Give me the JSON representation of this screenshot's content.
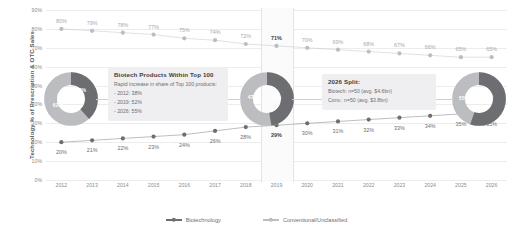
{
  "chart_data": {
    "type": "line",
    "title": "",
    "xlabel": "",
    "ylabel": "Technology % of Prescription & OTC Sales",
    "ylim": [
      0,
      90
    ],
    "ytick_labels": [
      "0%",
      "10%",
      "20%",
      "30%",
      "40%",
      "50%",
      "60%",
      "70%",
      "80%",
      "90%"
    ],
    "ytick_values": [
      0,
      10,
      20,
      30,
      40,
      50,
      60,
      70,
      80,
      90
    ],
    "grid": true,
    "legend_position": "bottom",
    "categories": [
      "2012",
      "2013",
      "2014",
      "2015",
      "2016",
      "2017",
      "2018",
      "2019",
      "2020",
      "2021",
      "2022",
      "2023",
      "2024",
      "2025",
      "2026"
    ],
    "series": [
      {
        "name": "Biotechnology",
        "color": "#6d6e71",
        "values": [
          20,
          21,
          22,
          23,
          24,
          26,
          28,
          29,
          30,
          31,
          32,
          33,
          34,
          35,
          35
        ],
        "labels": [
          "20%",
          "21%",
          "22%",
          "23%",
          "24%",
          "26%",
          "28%",
          "29%",
          "30%",
          "31%",
          "32%",
          "33%",
          "34%",
          "35%",
          "35%"
        ]
      },
      {
        "name": "Conventional/Unclassified",
        "color": "#bcbdc0",
        "values": [
          80,
          79,
          78,
          77,
          75,
          74,
          72,
          71,
          70,
          69,
          68,
          67,
          66,
          65,
          65
        ],
        "labels": [
          "80%",
          "79%",
          "78%",
          "77%",
          "75%",
          "74%",
          "72%",
          "71%",
          "70%",
          "69%",
          "68%",
          "67%",
          "66%",
          "65%",
          "65%"
        ]
      }
    ],
    "highlight_category": "2019"
  },
  "legend": {
    "items": [
      {
        "label": "Biotechnology",
        "color": "#6d6e71"
      },
      {
        "label": "Conventional/Unclassified",
        "color": "#bcbdc0"
      }
    ]
  },
  "donuts": [
    {
      "name": "donut-2012",
      "biotech_pct": 38,
      "conventional_pct": 62,
      "biotech_label": "38%",
      "conventional_label": "62%"
    },
    {
      "name": "donut-2019",
      "biotech_pct": 47,
      "conventional_pct": 53,
      "biotech_label": "47%",
      "conventional_label": "53%"
    },
    {
      "name": "donut-2026",
      "biotech_pct": 55,
      "conventional_pct": 45,
      "biotech_label": "55%",
      "conventional_label": "45%"
    }
  ],
  "callouts": {
    "left": {
      "title": "Biotech Products Within Top 100",
      "lead": "Rapid increase in share of Top 100 products:",
      "line1": "- 2012: 38%",
      "line2": "- 2019: 52%",
      "line3": "- 2026: 55%"
    },
    "right": {
      "title": "2026 Split:",
      "line1": "Biotech: n=50 (avg. $4.6bn)",
      "line2": "Conv.: n=50 (avg. $3.8bn)"
    }
  },
  "colors": {
    "biotech": "#6d6e71",
    "conventional": "#bcbdc0",
    "grid": "#ececec",
    "panel": "#efeff1"
  }
}
